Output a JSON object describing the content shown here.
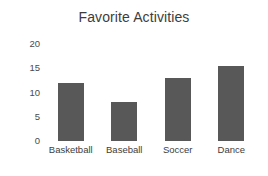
{
  "chart_data": {
    "type": "bar",
    "title": "Favorite Activities",
    "xlabel": "",
    "ylabel": "",
    "categories": [
      "Basketball",
      "Baseball",
      "Soccer",
      "Dance"
    ],
    "values": [
      12,
      8,
      13,
      15.5
    ],
    "ylim": [
      0,
      20
    ],
    "yticks": [
      0,
      5,
      10,
      15,
      20
    ],
    "ytick_labels": [
      "0",
      "5",
      "10",
      "15",
      "20"
    ],
    "grid": false,
    "legend": null,
    "bar_color": "#585858",
    "background_color": "#ffffff",
    "title_color": "#3d3d3d",
    "axis_label_color": "#3d3d3d"
  }
}
